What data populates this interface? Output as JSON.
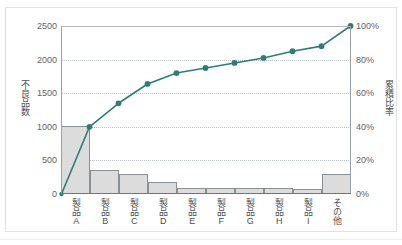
{
  "top_caption": "",
  "chart_data": {
    "type": "bar",
    "title": "",
    "subtitle": "",
    "xlabel": "",
    "ylabel": "不良品数",
    "y2label": "累積比率",
    "categories": [
      "製品A",
      "製品B",
      "製品C",
      "製品D",
      "製品E",
      "製品F",
      "製品G",
      "製品H",
      "製品I",
      "その他"
    ],
    "series": [
      {
        "name": "不良品数",
        "type": "bar",
        "axis": "left",
        "values": [
          1000,
          350,
          290,
          165,
          75,
          75,
          75,
          75,
          65,
          290
        ],
        "color": "#dcdcdc",
        "border_color": "#8a9094"
      },
      {
        "name": "累積比率",
        "type": "line",
        "axis": "right",
        "values": [
          40,
          54,
          65.5,
          72,
          75,
          78,
          81,
          85,
          88,
          100
        ],
        "color": "#2e7d74",
        "marker": "circle"
      }
    ],
    "line_origin": {
      "value": 0,
      "label": "0%"
    },
    "ylim": [
      0,
      2500
    ],
    "y2lim": [
      0,
      100
    ],
    "yticks": [
      "0",
      "500",
      "1000",
      "1500",
      "2000",
      "2500"
    ],
    "ytick_values": [
      0,
      500,
      1000,
      1500,
      2000,
      2500
    ],
    "y2ticks": [
      "0%",
      "20%",
      "40%",
      "60%",
      "80%",
      "100%"
    ],
    "y2tick_values": [
      0,
      20,
      40,
      60,
      80,
      100
    ],
    "grid": true,
    "grid_axis": "y",
    "legend": false,
    "legend_position": "none",
    "background": "#ffffff",
    "frame_color": "#dfe3e6"
  }
}
